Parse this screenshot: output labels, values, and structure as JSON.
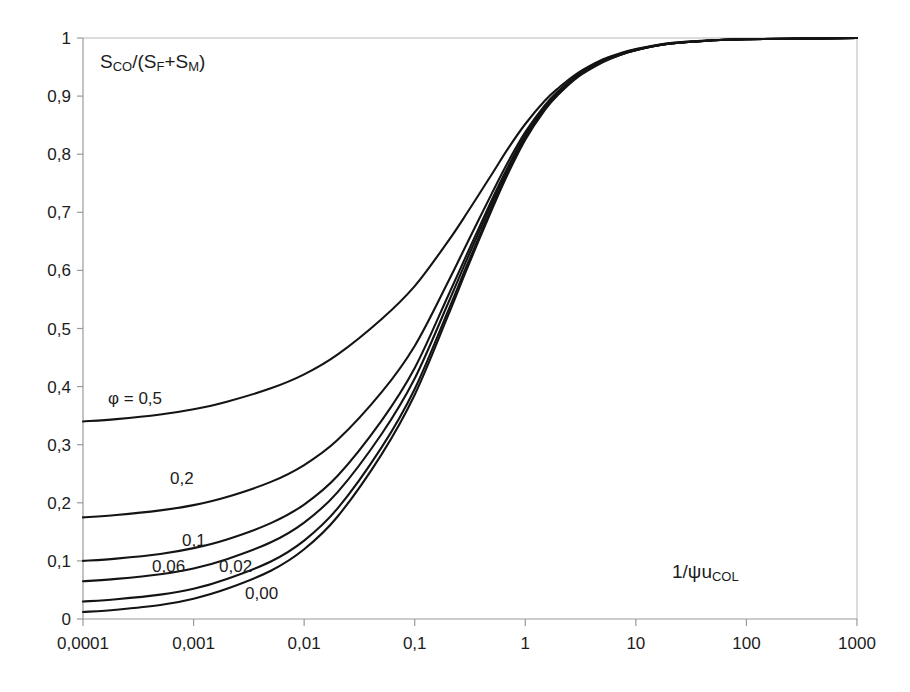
{
  "chart_data": {
    "type": "line",
    "title": "",
    "xlabel": "1/ψu_COL",
    "xlabel_main": "1/ψu",
    "xlabel_sub": "COL",
    "ylabel": "S_CO/(S_F+S_M)",
    "ylabel_parts": {
      "s1": "S",
      "sub1": "CO",
      "slash": "/(S",
      "sub2": "F",
      "plus": "+S",
      "sub3": "M",
      "close": ")"
    },
    "xscale": "log",
    "yscale": "linear",
    "xlim": [
      0.0001,
      1000
    ],
    "ylim": [
      0,
      1
    ],
    "grid": false,
    "legend": "inline-curve-labels",
    "x_tick_labels": [
      "0,0001",
      "0,001",
      "0,01",
      "0,1",
      "1",
      "10",
      "100",
      "1000"
    ],
    "x_tick_values": [
      0.0001,
      0.001,
      0.01,
      0.1,
      1,
      10,
      100,
      1000
    ],
    "y_tick_labels": [
      "0",
      "0,1",
      "0,2",
      "0,3",
      "0,4",
      "0,5",
      "0,6",
      "0,7",
      "0,8",
      "0,9",
      "1"
    ],
    "y_tick_values": [
      0,
      0.1,
      0.2,
      0.3,
      0.4,
      0.5,
      0.6,
      0.7,
      0.8,
      0.9,
      1
    ],
    "annotations": [
      {
        "name": "phi-0-5",
        "text": "φ = 0,5",
        "x_px": 108,
        "y_px": 404
      },
      {
        "name": "phi-0-2",
        "text": "0,2",
        "x_px": 170,
        "y_px": 484
      },
      {
        "name": "phi-0-1",
        "text": "0,1",
        "x_px": 182,
        "y_px": 546
      },
      {
        "name": "phi-0-06",
        "text": "0,06",
        "x_px": 152,
        "y_px": 572
      },
      {
        "name": "phi-0-02",
        "text": "0,02",
        "x_px": 219,
        "y_px": 572
      },
      {
        "name": "phi-0-00",
        "text": "0,00",
        "x_px": 245,
        "y_px": 599
      }
    ],
    "series": [
      {
        "name": "φ = 0,5",
        "phi": 0.5,
        "x": [
          0.0001,
          0.0002,
          0.0005,
          0.001,
          0.002,
          0.005,
          0.01,
          0.02,
          0.05,
          0.1,
          0.2,
          0.3,
          0.5,
          0.7,
          1,
          1.5,
          2,
          3,
          5,
          7,
          10,
          20,
          50,
          100,
          300,
          1000
        ],
        "values": [
          0.34,
          0.344,
          0.352,
          0.361,
          0.374,
          0.397,
          0.421,
          0.455,
          0.516,
          0.573,
          0.65,
          0.7,
          0.766,
          0.81,
          0.852,
          0.892,
          0.914,
          0.94,
          0.963,
          0.973,
          0.981,
          0.991,
          0.996,
          0.998,
          0.999,
          1.0
        ]
      },
      {
        "name": "0,2",
        "phi": 0.2,
        "x": [
          0.0001,
          0.0002,
          0.0005,
          0.001,
          0.002,
          0.005,
          0.01,
          0.02,
          0.05,
          0.1,
          0.2,
          0.3,
          0.5,
          0.7,
          1,
          1.5,
          2,
          3,
          5,
          7,
          10,
          20,
          50,
          100,
          300,
          1000
        ],
        "values": [
          0.175,
          0.179,
          0.187,
          0.196,
          0.21,
          0.236,
          0.265,
          0.308,
          0.39,
          0.47,
          0.58,
          0.648,
          0.733,
          0.787,
          0.838,
          0.884,
          0.909,
          0.937,
          0.961,
          0.972,
          0.98,
          0.991,
          0.996,
          0.998,
          0.999,
          1.0
        ]
      },
      {
        "name": "0,1",
        "phi": 0.1,
        "x": [
          0.0001,
          0.0002,
          0.0005,
          0.001,
          0.002,
          0.005,
          0.01,
          0.02,
          0.05,
          0.1,
          0.2,
          0.3,
          0.5,
          0.7,
          1,
          1.5,
          2,
          3,
          5,
          7,
          10,
          20,
          50,
          100,
          300,
          1000
        ],
        "values": [
          0.1,
          0.104,
          0.112,
          0.122,
          0.137,
          0.165,
          0.197,
          0.246,
          0.341,
          0.432,
          0.556,
          0.63,
          0.722,
          0.779,
          0.833,
          0.881,
          0.907,
          0.936,
          0.96,
          0.971,
          0.98,
          0.99,
          0.996,
          0.998,
          0.999,
          1.0
        ]
      },
      {
        "name": "0,06",
        "phi": 0.06,
        "x": [
          0.0001,
          0.0002,
          0.0005,
          0.001,
          0.002,
          0.005,
          0.01,
          0.02,
          0.05,
          0.1,
          0.2,
          0.3,
          0.5,
          0.7,
          1,
          1.5,
          2,
          3,
          5,
          7,
          10,
          20,
          50,
          100,
          300,
          1000
        ],
        "values": [
          0.065,
          0.069,
          0.077,
          0.087,
          0.103,
          0.132,
          0.166,
          0.218,
          0.318,
          0.414,
          0.543,
          0.621,
          0.716,
          0.775,
          0.83,
          0.879,
          0.906,
          0.935,
          0.959,
          0.971,
          0.979,
          0.99,
          0.996,
          0.998,
          0.999,
          1.0
        ]
      },
      {
        "name": "0,02",
        "phi": 0.02,
        "x": [
          0.0001,
          0.0002,
          0.0005,
          0.001,
          0.002,
          0.005,
          0.01,
          0.02,
          0.05,
          0.1,
          0.2,
          0.3,
          0.5,
          0.7,
          1,
          1.5,
          2,
          3,
          5,
          7,
          10,
          20,
          50,
          100,
          300,
          1000
        ],
        "values": [
          0.03,
          0.034,
          0.042,
          0.052,
          0.069,
          0.099,
          0.135,
          0.19,
          0.295,
          0.396,
          0.53,
          0.611,
          0.709,
          0.77,
          0.827,
          0.877,
          0.904,
          0.934,
          0.959,
          0.97,
          0.979,
          0.99,
          0.996,
          0.998,
          0.999,
          1.0
        ]
      },
      {
        "name": "0,00",
        "phi": 0.0,
        "x": [
          0.0001,
          0.0002,
          0.0005,
          0.001,
          0.002,
          0.005,
          0.01,
          0.02,
          0.05,
          0.1,
          0.2,
          0.3,
          0.5,
          0.7,
          1,
          1.5,
          2,
          3,
          5,
          7,
          10,
          20,
          50,
          100,
          300,
          1000
        ],
        "values": [
          0.012,
          0.016,
          0.024,
          0.035,
          0.052,
          0.083,
          0.12,
          0.176,
          0.283,
          0.386,
          0.522,
          0.605,
          0.705,
          0.767,
          0.825,
          0.876,
          0.903,
          0.933,
          0.958,
          0.97,
          0.979,
          0.99,
          0.996,
          0.998,
          0.999,
          1.0
        ]
      }
    ]
  },
  "plot_geometry": {
    "left_px": 83,
    "right_px": 857,
    "top_px": 38,
    "bottom_px": 619
  }
}
